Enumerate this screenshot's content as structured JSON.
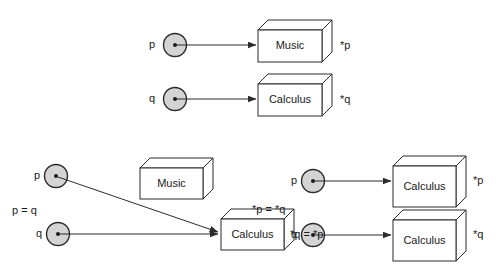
{
  "diagram": {
    "colors": {
      "stroke": "#2b2b2b",
      "node_fill": "#d4d4d4",
      "box_face": "#ffffff",
      "text": "#1a1a1a",
      "background": "#ffffff"
    },
    "panels": [
      {
        "id": "initial",
        "relation_label": "",
        "pointers": [
          {
            "name": "p",
            "deref_label": "*p",
            "target": "Music"
          },
          {
            "name": "q",
            "deref_label": "*q",
            "target": "Calculus"
          }
        ],
        "objects": [
          {
            "label": "Music"
          },
          {
            "label": "Calculus"
          }
        ]
      },
      {
        "id": "pointer-assignment",
        "relation_label": "p = q",
        "pointers": [
          {
            "name": "p",
            "deref_label": "",
            "target": "Calculus"
          },
          {
            "name": "q",
            "deref_label": "*q = *p",
            "target": "Calculus"
          }
        ],
        "objects": [
          {
            "label": "Music"
          },
          {
            "label": "Calculus"
          }
        ]
      },
      {
        "id": "value-assignment",
        "relation_label": "*p = *q",
        "pointers": [
          {
            "name": "p",
            "deref_label": "*p",
            "target": "Calculus"
          },
          {
            "name": "q",
            "deref_label": "*q",
            "target": "Calculus"
          }
        ],
        "objects": [
          {
            "label": "Calculus"
          },
          {
            "label": "Calculus"
          }
        ]
      }
    ],
    "labels": {
      "top_p": "p",
      "top_q": "q",
      "top_music": "Music",
      "top_calculus": "Calculus",
      "top_star_p": "*p",
      "top_star_q": "*q",
      "bl_p": "p",
      "bl_q": "q",
      "bl_p_eq_q": "p = q",
      "bl_music": "Music",
      "bl_calculus": "Calculus",
      "bl_star_q_eq_star_p": "*q = *p",
      "br_star_p_eq_star_q": "*p = *q",
      "br_p": "p",
      "br_q": "q",
      "br_calculus_top": "Calculus",
      "br_calculus_bottom": "Calculus",
      "br_star_p": "*p",
      "br_star_q": "*q"
    }
  }
}
